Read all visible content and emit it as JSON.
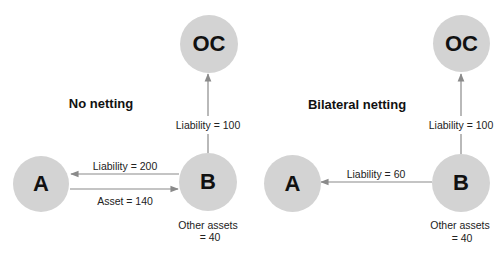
{
  "colors": {
    "node_fill": "#d3d3d3",
    "edge": "#8a8a8a",
    "text": "#111111"
  },
  "panels": [
    {
      "title": "No netting",
      "nodes": {
        "oc": "OC",
        "a": "A",
        "b": "B"
      },
      "edges": {
        "b_to_oc": "Liability = 100",
        "b_to_a": "Liability = 200",
        "a_to_b": "Asset = 140"
      },
      "other_assets": {
        "line1": "Other assets",
        "line2": "= 40"
      }
    },
    {
      "title": "Bilateral netting",
      "nodes": {
        "oc": "OC",
        "a": "A",
        "b": "B"
      },
      "edges": {
        "b_to_oc": "Liability = 100",
        "b_to_a": "Liability = 60"
      },
      "other_assets": {
        "line1": "Other assets",
        "line2": "= 40"
      }
    }
  ]
}
